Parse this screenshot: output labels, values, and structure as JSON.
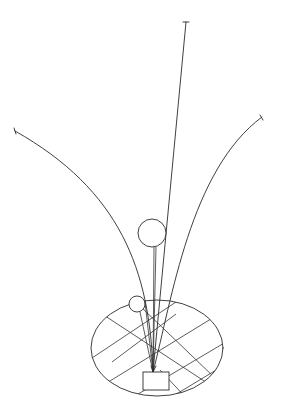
{
  "diagram": {
    "colors": {
      "background": "#ffffff",
      "line": "#2a2a2a"
    },
    "base_rect": {
      "x": 143,
      "y": 372,
      "width": 26,
      "height": 18
    },
    "convergence_point": {
      "x": 153,
      "y": 372
    },
    "ellipse": {
      "cx": 157,
      "cy": 348,
      "rx": 66,
      "ry": 48
    },
    "large_circle": {
      "cx": 152,
      "cy": 233,
      "r": 14
    },
    "small_circle": {
      "cx": 137,
      "cy": 304,
      "r": 8
    },
    "strokes": [
      {
        "name": "straight-rod",
        "end": {
          "x": 186,
          "y": 22
        }
      },
      {
        "name": "left-arc",
        "end": {
          "x": 15,
          "y": 131
        }
      },
      {
        "name": "right-arc",
        "end": {
          "x": 262,
          "y": 117
        }
      }
    ]
  }
}
